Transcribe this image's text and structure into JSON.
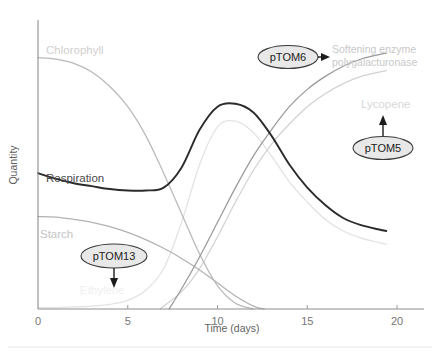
{
  "chart_data": {
    "type": "line",
    "title": "",
    "xlabel": "Time (days)",
    "ylabel": "Quantity",
    "xlim": [
      0,
      21.5
    ],
    "ylim": [
      0,
      100
    ],
    "xticks": [
      0,
      5,
      10,
      15,
      20
    ],
    "xtick_labels": [
      "0",
      "5",
      "10",
      "15",
      "20"
    ],
    "yticks": [],
    "ytick_labels": [],
    "grid": false,
    "legend": "inline-labels",
    "series": [
      {
        "name": "Chlorophyll",
        "color": "#b9b9b9",
        "label_x": 5.6,
        "label_y": 89,
        "x": [
          0,
          1,
          2,
          3,
          4,
          5,
          6,
          7,
          8,
          9,
          10,
          11,
          12
        ],
        "y": [
          87,
          86.5,
          85,
          82,
          77,
          70,
          60,
          47,
          33,
          19,
          8,
          2,
          0
        ]
      },
      {
        "name": "Respiration",
        "color": "#2b2b2b",
        "label_x": 1.2,
        "label_y": 53,
        "x": [
          0,
          1,
          2,
          3,
          4,
          5,
          6,
          7,
          8,
          9,
          10,
          11,
          12,
          13,
          14,
          15,
          16,
          17,
          18,
          19,
          19.4
        ],
        "y": [
          47,
          45,
          43.5,
          42.5,
          41.5,
          41,
          41,
          42,
          49,
          62,
          70,
          71,
          68,
          60,
          50,
          42,
          36,
          31.5,
          29,
          27.5,
          27
        ]
      },
      {
        "name": "Starch",
        "color": "#b2b2b2",
        "label_x": 0.5,
        "label_y": 30,
        "x": [
          0,
          1,
          2,
          3,
          4,
          5,
          6,
          7,
          8,
          9,
          10,
          11,
          12,
          12.6
        ],
        "y": [
          32,
          31.8,
          31,
          30,
          28.5,
          26.5,
          24,
          21,
          17.5,
          13.5,
          9,
          4.5,
          1,
          0
        ]
      },
      {
        "name": "Ethylene",
        "color": "#e2e2e2",
        "label_x": 2.7,
        "label_y": 4,
        "x": [
          0,
          1,
          2,
          3,
          4,
          5,
          6,
          7,
          8,
          9,
          10,
          11,
          12,
          13,
          14,
          15,
          16,
          17,
          18,
          19,
          19.4
        ],
        "y": [
          0.5,
          0.5,
          0.7,
          1,
          1.6,
          3,
          6.5,
          14,
          30,
          50,
          63,
          65,
          61,
          53,
          44,
          37,
          31,
          27,
          24.5,
          23,
          22.5
        ]
      },
      {
        "name": "Lycopene",
        "color": "#d2d2d2",
        "label_x": 16.6,
        "label_y": 74,
        "x": [
          6.8,
          8,
          9,
          10,
          11,
          12,
          13,
          14,
          15,
          16,
          17,
          18,
          19,
          19.4
        ],
        "y": [
          0,
          6,
          14,
          25,
          37,
          48,
          57,
          64,
          70,
          74.5,
          78,
          80.5,
          82,
          82.5
        ]
      },
      {
        "name": "Softening enzyme polygalacturonase",
        "color": "#9a9a9a",
        "label_x": 16.6,
        "label_y": 92,
        "x": [
          7.3,
          8,
          9,
          10,
          11,
          12,
          13,
          14,
          15,
          16,
          17,
          18,
          19,
          19.4
        ],
        "y": [
          0,
          7,
          18,
          30,
          42,
          53,
          62,
          70,
          76,
          80.5,
          84,
          86.5,
          88,
          88.5
        ]
      }
    ],
    "annotations": [
      {
        "id": "ptom13",
        "label": "pTOM13",
        "target": "Ethylene",
        "x": 4.2,
        "y": 20,
        "arrow": "down"
      },
      {
        "id": "ptom6",
        "label": "pTOM6",
        "target": "Softening enzyme polygalacturonase",
        "x": 13.2,
        "y": 92,
        "arrow": "right"
      },
      {
        "id": "ptom5",
        "label": "pTOM5",
        "target": "Lycopene",
        "x": 18.6,
        "y": 57,
        "arrow": "up"
      }
    ],
    "enzyme_label_lines": [
      "Softening enzyme",
      "polygalacturonase"
    ]
  },
  "axes": {
    "x_title": "Time (days)",
    "y_title": "Quantity",
    "x_ticks": [
      "0",
      "5",
      "10",
      "15",
      "20"
    ]
  },
  "series_labels": {
    "chlorophyll": "Chlorophyll",
    "respiration": "Respiration",
    "starch": "Starch",
    "ethylene": "Ethylene",
    "lycopene": "Lycopene",
    "enzyme_line1": "Softening enzyme",
    "enzyme_line2": "polygalacturonase"
  },
  "callouts": {
    "ptom13": "pTOM13",
    "ptom6": "pTOM6",
    "ptom5": "pTOM5"
  },
  "colors": {
    "axis": "#8d8d8d",
    "respiration": "#2b2b2b",
    "chlorophyll": "#b9b9b9",
    "starch": "#b2b2b2",
    "ethylene": "#e2e2e2",
    "lycopene": "#d2d2d2",
    "enzyme": "#9a9a9a",
    "callout_fill": "#e8e8e8",
    "callout_stroke": "#4a4a4a",
    "divider": "#e6e6e6"
  }
}
